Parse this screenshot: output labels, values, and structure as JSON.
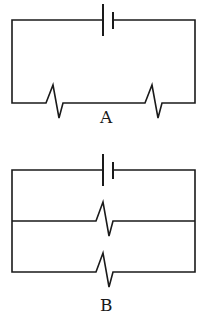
{
  "diagram": {
    "type": "circuit-diagrams",
    "circuits": [
      {
        "label": "A",
        "configuration": "series",
        "components": [
          "battery",
          "resistor",
          "resistor"
        ]
      },
      {
        "label": "B",
        "configuration": "parallel",
        "components": [
          "battery",
          "resistor",
          "resistor"
        ]
      }
    ],
    "colors": {
      "line": "#1a1a1a",
      "background": "#ffffff"
    }
  }
}
